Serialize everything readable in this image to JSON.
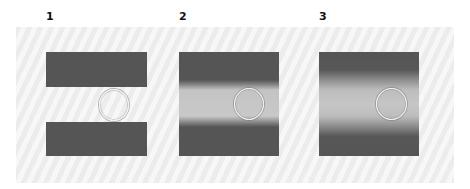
{
  "figure": {
    "panels": [
      {
        "label": "1",
        "blur": "none"
      },
      {
        "label": "2",
        "blur": "slight"
      },
      {
        "label": "3",
        "blur": "strong"
      }
    ],
    "colors": {
      "bar": "#555555",
      "middle_band_blurred": "#c4c4c4",
      "background_stripe_a": "#ececec",
      "background_stripe_b": "#f7f7f7",
      "circle_outline": "#f4f4f4"
    }
  }
}
